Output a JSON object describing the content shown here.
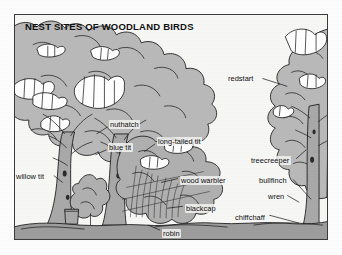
{
  "figure": {
    "title": "NEST SITES OF WOODLAND BIRDS",
    "frame_border_color": "#3a3a3a",
    "background_color": "#f7f7f5",
    "canopy_fill": "#b9b9b9",
    "trunk_fill": "#a8a8a8",
    "ground_fill": "#9d9d9d",
    "ink_color": "#1a1a1a",
    "bird_fill": "#ffffff"
  },
  "labels": [
    {
      "id": "redstart",
      "text": "redstart",
      "x": 227,
      "y": 74,
      "leader": {
        "x1": 263,
        "y1": 78,
        "x2": 288,
        "y2": 86
      }
    },
    {
      "id": "nuthatch",
      "text": "nuthatch",
      "x": 109,
      "y": 120,
      "leader": {
        "x1": 107,
        "y1": 127,
        "x2": 96,
        "y2": 134
      }
    },
    {
      "id": "blue-tit",
      "text": "blue tit",
      "x": 108,
      "y": 143,
      "leader": {
        "x1": 106,
        "y1": 150,
        "x2": 95,
        "y2": 155
      }
    },
    {
      "id": "long-tailed-tit",
      "text": "long-tailed tit",
      "x": 157,
      "y": 137,
      "leader": {
        "x1": 155,
        "y1": 144,
        "x2": 144,
        "y2": 152
      }
    },
    {
      "id": "treecreeper",
      "text": "treecreeper",
      "x": 250,
      "y": 156,
      "leader": {
        "x1": 297,
        "y1": 159,
        "x2": 307,
        "y2": 150
      }
    },
    {
      "id": "willow-tit",
      "text": "willow tit",
      "x": 15,
      "y": 172,
      "leader": {
        "x1": 53,
        "y1": 176,
        "x2": 62,
        "y2": 183
      }
    },
    {
      "id": "wood-warbler",
      "text": "wood warbler",
      "x": 180,
      "y": 176,
      "leader": {
        "x1": 178,
        "y1": 179,
        "x2": 161,
        "y2": 183
      }
    },
    {
      "id": "bullfinch",
      "text": "bullfinch",
      "x": 258,
      "y": 176,
      "leader": {
        "x1": 294,
        "y1": 180,
        "x2": 312,
        "y2": 200
      }
    },
    {
      "id": "wren",
      "text": "wren",
      "x": 267,
      "y": 192,
      "leader": {
        "x1": 288,
        "y1": 196,
        "x2": 300,
        "y2": 203
      }
    },
    {
      "id": "blackcap",
      "text": "blackcap",
      "x": 185,
      "y": 204,
      "leader": {
        "x1": 183,
        "y1": 207,
        "x2": 167,
        "y2": 209
      }
    },
    {
      "id": "chiffchaff",
      "text": "chiffchaff",
      "x": 234,
      "y": 213,
      "leader": {
        "x1": 270,
        "y1": 216,
        "x2": 300,
        "y2": 224
      }
    },
    {
      "id": "robin",
      "text": "robin",
      "x": 162,
      "y": 229,
      "leader": {
        "x1": 160,
        "y1": 231,
        "x2": 148,
        "y2": 226
      }
    }
  ],
  "species_list": [
    "redstart",
    "nuthatch",
    "blue tit",
    "long-tailed tit",
    "treecreeper",
    "willow tit",
    "wood warbler",
    "bullfinch",
    "wren",
    "blackcap",
    "chiffchaff",
    "robin"
  ],
  "scene_elements": {
    "left_canopy": "large-leafy-canopy-mass",
    "right_tree": "conifer-like-tree-with-trunk",
    "left_trunk": "bare-deciduous-trunk",
    "center_trunk": "bare-deciduous-trunk",
    "shrub": "small-shrub",
    "stump": "tree-stump",
    "bramble": "bramble-thicket",
    "ground": "ground-line",
    "birds_count": 12
  }
}
